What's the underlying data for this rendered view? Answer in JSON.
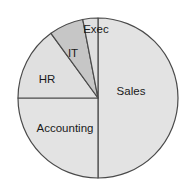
{
  "chart_data": {
    "type": "pie",
    "title": "",
    "subtitle": "",
    "xlabel": "",
    "ylabel": "",
    "legend_position": "none",
    "grid": false,
    "labels_inside": true,
    "start_angle_deg": 0,
    "direction": "clockwise",
    "categories": [
      "Sales",
      "Accounting",
      "HR",
      "IT",
      "Exec"
    ],
    "values": [
      50,
      25,
      15,
      7,
      3
    ],
    "units": "percent",
    "slices": [
      {
        "label": "Sales",
        "value": 50,
        "start_deg": 0,
        "end_deg": 180,
        "color": "#e3e3e3",
        "label_x": 131,
        "label_y": 92
      },
      {
        "label": "Accounting",
        "value": 25,
        "start_deg": 180,
        "end_deg": 270,
        "color": "#e3e3e3",
        "label_x": 65,
        "label_y": 129
      },
      {
        "label": "HR",
        "value": 15,
        "start_deg": 270,
        "end_deg": 324,
        "color": "#e0e0e0",
        "label_x": 47,
        "label_y": 80
      },
      {
        "label": "IT",
        "value": 7,
        "start_deg": 324,
        "end_deg": 349,
        "color": "#c6c6c6",
        "label_x": 73,
        "label_y": 54
      },
      {
        "label": "Exec",
        "value": 3,
        "start_deg": 349,
        "end_deg": 360,
        "color": "#e0e0e0",
        "label_x": 96,
        "label_y": 30
      }
    ],
    "geometry": {
      "center_x": 98,
      "center_y": 98,
      "radius": 80
    },
    "style": {
      "outline_color": "#4a4a4a",
      "outline_width": 1.2,
      "background": "#ffffff",
      "label_color": "#1a1a1a"
    }
  }
}
